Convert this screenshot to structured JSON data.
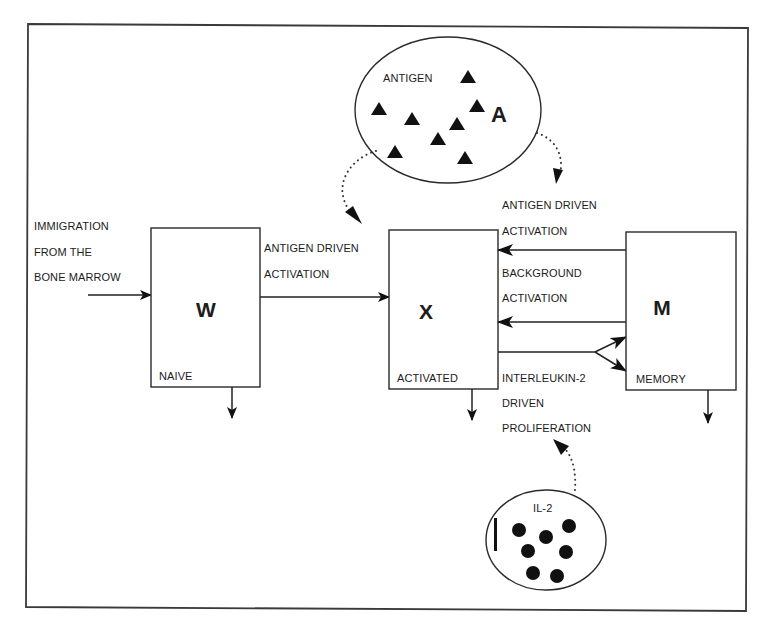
{
  "diagram": {
    "colors": {
      "ink": "#1c1c1c",
      "background": "#ffffff",
      "frame": "#3a3a3a"
    },
    "antigen_pool": {
      "label": "ANTIGEN",
      "symbol": "A",
      "particle_shape": "triangle",
      "particle_count": 8
    },
    "il2_pool": {
      "label": "IL-2",
      "particle_shape": "circle",
      "particle_count": 7
    },
    "compartments": [
      {
        "id": "W",
        "symbol": "W",
        "label": "NAIVE"
      },
      {
        "id": "X",
        "symbol": "X",
        "label": "ACTIVATED"
      },
      {
        "id": "M",
        "symbol": "M",
        "label": "MEMORY"
      }
    ],
    "flows": {
      "immigration": {
        "lines": [
          "IMMIGRATION",
          "FROM THE",
          "BONE MARROW"
        ]
      },
      "naive_to_activated": {
        "lines": [
          "ANTIGEN DRIVEN",
          "ACTIVATION"
        ]
      },
      "memory_antigen_activation": {
        "lines": [
          "ANTIGEN DRIVEN",
          "ACTIVATION"
        ]
      },
      "memory_background_activation": {
        "lines": [
          "BACKGROUND",
          "ACTIVATION"
        ]
      },
      "il2_proliferation": {
        "lines": [
          "INTERLEUKIN-2",
          "DRIVEN",
          "PROLIFERATION"
        ]
      }
    }
  }
}
